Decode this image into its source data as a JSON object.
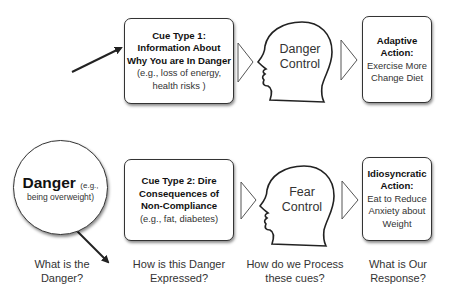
{
  "danger": {
    "title": "Danger",
    "example_inline": "(e.g.,",
    "example_rest": "being overweight)"
  },
  "cues": [
    {
      "title_lines": [
        "Cue Type 1:",
        "Information About",
        "Why You are In Danger"
      ],
      "example_lines": [
        "(e.g., loss of energy,",
        "health risks )"
      ]
    },
    {
      "title_lines": [
        "Cue Type 2: Dire",
        "Consequences of",
        "Non-Compliance"
      ],
      "example_lines": [
        "(e.g., fat, diabetes)"
      ]
    }
  ],
  "processes": [
    {
      "label_lines": [
        "Danger",
        "Control"
      ]
    },
    {
      "label_lines": [
        "Fear",
        "Control"
      ]
    }
  ],
  "actions": [
    {
      "title_lines": [
        "Adaptive",
        "Action:"
      ],
      "body_lines": [
        "Exercise More",
        "Change Diet"
      ]
    },
    {
      "title_lines": [
        "Idiosyncratic",
        "Action:"
      ],
      "body_lines": [
        "Eat to Reduce",
        "Anxiety about",
        "Weight"
      ]
    }
  ],
  "captions": [
    {
      "lines": [
        "What is the",
        "Danger?"
      ]
    },
    {
      "lines": [
        "How is this Danger",
        "Expressed?"
      ]
    },
    {
      "lines": [
        "How do we Process",
        "these cues?"
      ]
    },
    {
      "lines": [
        "What is Our",
        "Response?"
      ]
    }
  ],
  "colors": {
    "stroke": "#333333",
    "background": "#ffffff",
    "text": "#222222"
  }
}
